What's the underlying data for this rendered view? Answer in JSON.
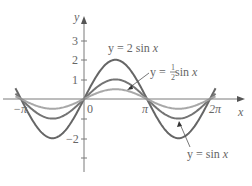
{
  "chart_data": {
    "type": "line",
    "title": "",
    "xlabel": "x",
    "ylabel": "y",
    "xlim": [
      -3.35,
      6.6
    ],
    "ylim": [
      -3.2,
      3.8
    ],
    "grid": false,
    "x_ticks": [
      {
        "value": -3.14159,
        "label": "−π"
      },
      {
        "value": 0,
        "label": "0"
      },
      {
        "value": 3.14159,
        "label": "π"
      },
      {
        "value": 6.28319,
        "label": "2π"
      }
    ],
    "y_ticks": [
      {
        "value": 3,
        "label": "3"
      },
      {
        "value": 2,
        "label": "2"
      },
      {
        "value": 1,
        "label": "1"
      },
      {
        "value": -1,
        "label": ""
      },
      {
        "value": -2,
        "label": "−2"
      },
      {
        "value": -3,
        "label": ""
      }
    ],
    "series": [
      {
        "name": "y = 2 sin x",
        "amplitude": 2,
        "color": "#666666",
        "x": [
          -3.14159,
          -1.5708,
          0,
          1.5708,
          3.14159,
          4.71239,
          6.28319
        ],
        "values": [
          0,
          -2,
          0,
          2,
          0,
          -2,
          0
        ]
      },
      {
        "name": "y = sin x",
        "amplitude": 1,
        "color": "#747474",
        "x": [
          -3.14159,
          -1.5708,
          0,
          1.5708,
          3.14159,
          4.71239,
          6.28319
        ],
        "values": [
          0,
          -1,
          0,
          1,
          0,
          -1,
          0
        ]
      },
      {
        "name": "y = ½ sin x",
        "amplitude": 0.5,
        "color": "#a8a8a8",
        "x": [
          -3.14159,
          -1.5708,
          0,
          1.5708,
          3.14159,
          4.71239,
          6.28319
        ],
        "values": [
          0,
          -0.5,
          0,
          0.5,
          0,
          -0.5,
          0
        ]
      }
    ],
    "annotations": [
      {
        "text": "y = 2 sin x",
        "target_series": "y = 2 sin x"
      },
      {
        "text": "y = ½ sin x",
        "target_series": "y = ½ sin x"
      },
      {
        "text": "y = sin x",
        "target_series": "y = sin x"
      }
    ]
  },
  "labels": {
    "y_axis": "y",
    "x_axis": "x",
    "origin": "0",
    "neg_pi": "−π",
    "pi": "π",
    "two_pi": "2π",
    "y3": "3",
    "y2": "2",
    "y1": "1",
    "yneg2": "−2",
    "ann_2sin_prefix": "y = 2 sin ",
    "ann_2sin_var": "x",
    "ann_half_prefix": "y = ",
    "ann_half_num": "1",
    "ann_half_den": "2",
    "ann_half_suffix": " sin ",
    "ann_half_var": "x",
    "ann_sin_prefix": "y = sin ",
    "ann_sin_var": "x"
  }
}
